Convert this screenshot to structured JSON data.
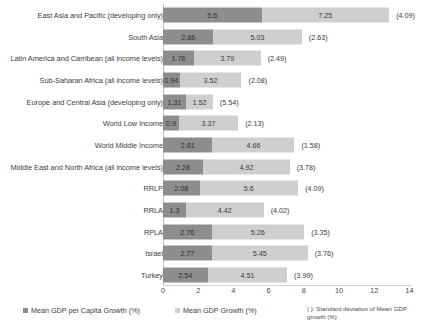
{
  "chart_data": {
    "type": "bar",
    "orientation": "horizontal",
    "stacked": true,
    "title": "",
    "xlabel": "",
    "ylabel": "",
    "xlim": [
      0,
      14
    ],
    "xticks": [
      0,
      2,
      4,
      6,
      8,
      10,
      12,
      14
    ],
    "grid": false,
    "legend_position": "bottom",
    "categories": [
      "East Asia and Pacific (developing only)",
      "South Asia",
      "Latin America and Carribean (all income levels)",
      "Sub-Saharan Africa (all income levels)",
      "Europe and Central Asia (developing only)",
      "World Low Income",
      "World Middle Income",
      "Middle East and North Africa (all income levels)",
      "RRLP",
      "RRLA",
      "RPLA",
      "Israel",
      "Turkey"
    ],
    "series": [
      {
        "name": "Mean GDP per Capita Growth (%)",
        "color": "#8d8d8d",
        "values": [
          5.6,
          2.86,
          1.76,
          0.94,
          1.31,
          0.9,
          2.81,
          2.28,
          2.08,
          1.3,
          2.76,
          2.77,
          2.54
        ]
      },
      {
        "name": "Mean GDP Growth (%)",
        "color": "#cfcfcf",
        "values": [
          7.25,
          5.03,
          3.79,
          3.52,
          1.52,
          3.37,
          4.66,
          4.92,
          5.6,
          4.42,
          5.26,
          5.45,
          4.51
        ]
      }
    ],
    "annotations": {
      "name": "Standard deviation of Mean GDP growth (%)",
      "values": [
        "(4.09)",
        "(2.63)",
        "(2.49)",
        "(2.08)",
        "(5.54)",
        "(2.13)",
        "(1.58)",
        "(3.78)",
        "(4.09)",
        "(4.02)",
        "(3.35)",
        "(3.76)",
        "(3.99)"
      ]
    }
  },
  "legend": {
    "series1_label": "Mean GDP per Capita Growth (%)",
    "series2_label": "Mean GDP Growth (%)",
    "note": "( ): Standard deviation of Mean GDP growth (%)"
  }
}
